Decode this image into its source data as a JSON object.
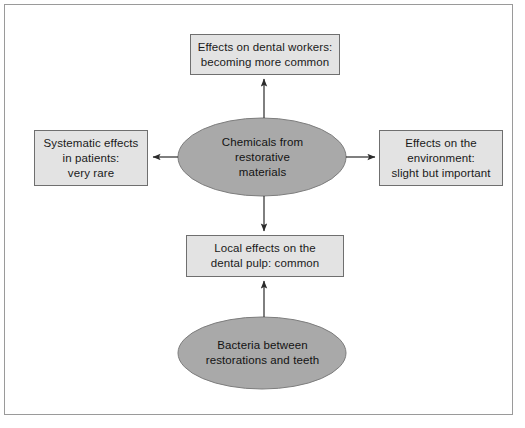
{
  "diagram": {
    "colors": {
      "box_fill": "#e3e3e3",
      "box_stroke": "#6f6f6f",
      "ellipse_fill": "#a9a9a9",
      "ellipse_stroke": "#7d7d7d",
      "arrow": "#2b2b2b",
      "frame": "#9a9a9a",
      "background": "#ffffff",
      "text": "#1a1a1a"
    },
    "nodes": {
      "center_ellipse": {
        "shape": "ellipse",
        "lines": [
          "Chemicals from",
          "restorative",
          "materials"
        ],
        "text": "Chemicals from restorative materials"
      },
      "bottom_ellipse": {
        "shape": "ellipse",
        "lines": [
          "Bacteria between",
          "restorations and teeth"
        ],
        "text": "Bacteria between restorations and teeth"
      },
      "top_box": {
        "shape": "rectangle",
        "lines": [
          "Effects on dental workers:",
          "becoming more common"
        ],
        "text": "Effects on dental workers: becoming more common"
      },
      "left_box": {
        "shape": "rectangle",
        "lines": [
          "Systematic effects",
          "in patients:",
          "very rare"
        ],
        "text": "Systematic effects in patients: very rare"
      },
      "right_box": {
        "shape": "rectangle",
        "lines": [
          "Effects on the",
          "environment:",
          "slight but important"
        ],
        "text": "Effects on the environment: slight but important"
      },
      "bottom_box": {
        "shape": "rectangle",
        "lines": [
          "Local effects on the",
          "dental pulp: common"
        ],
        "text": "Local effects on the dental pulp: common"
      }
    },
    "arrows": [
      {
        "name": "center-to-top-box",
        "from": "center_ellipse",
        "to": "top_box",
        "direction": "up"
      },
      {
        "name": "center-to-left-box",
        "from": "center_ellipse",
        "to": "left_box",
        "direction": "left"
      },
      {
        "name": "center-to-right-box",
        "from": "center_ellipse",
        "to": "right_box",
        "direction": "right"
      },
      {
        "name": "center-to-bottom-box",
        "from": "center_ellipse",
        "to": "bottom_box",
        "direction": "down"
      },
      {
        "name": "bottom-ellipse-to-bottom-box",
        "from": "bottom_ellipse",
        "to": "bottom_box",
        "direction": "up"
      }
    ]
  }
}
